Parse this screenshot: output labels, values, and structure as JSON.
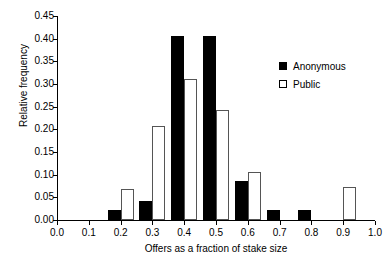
{
  "chart_data": {
    "type": "bar",
    "title": "",
    "subtitle": "",
    "xlabel": "Offers as a fraction of stake size",
    "ylabel": "Relative frequency",
    "categories": [
      0.2,
      0.3,
      0.4,
      0.5,
      0.6,
      0.7,
      0.8,
      0.9
    ],
    "series": [
      {
        "name": "Anonymous",
        "color": "#000000",
        "style": "filled",
        "values": [
          0.021,
          0.043,
          0.405,
          0.405,
          0.087,
          0.022,
          0.022,
          0.0
        ]
      },
      {
        "name": "Public",
        "color": "#ffffff",
        "style": "open",
        "values": [
          0.069,
          0.207,
          0.311,
          0.243,
          0.105,
          0.0,
          0.0,
          0.072
        ]
      }
    ],
    "xlim": [
      0.0,
      1.0
    ],
    "ylim": [
      0.0,
      0.45
    ],
    "xticks": [
      "0.0",
      "0.1",
      "0.2",
      "0.3",
      "0.4",
      "0.5",
      "0.6",
      "0.7",
      "0.8",
      "0.9",
      "1.0"
    ],
    "xtick_values": [
      0.0,
      0.1,
      0.2,
      0.3,
      0.4,
      0.5,
      0.6,
      0.7,
      0.8,
      0.9,
      1.0
    ],
    "yticks": [
      "0.00",
      "0.05",
      "0.10",
      "0.15",
      "0.20",
      "0.25",
      "0.30",
      "0.35",
      "0.40",
      "0.45"
    ],
    "ytick_values": [
      0.0,
      0.05,
      0.1,
      0.15,
      0.2,
      0.25,
      0.3,
      0.35,
      0.4,
      0.45
    ],
    "grid": false,
    "legend_position": "top-right",
    "legend": [
      {
        "label": "Anonymous",
        "swatch": "filled-square"
      },
      {
        "label": "Public",
        "swatch": "open-square"
      }
    ]
  },
  "axes": {
    "x_title": "Offers as a fraction of stake size",
    "y_title": "Relative frequency"
  },
  "colors": {
    "anonymous": "#000000",
    "public": "#ffffff",
    "axis": "#000000",
    "background": "#ffffff"
  }
}
